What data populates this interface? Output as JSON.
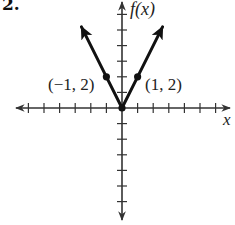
{
  "problem_number": "2.",
  "chart_data": {
    "type": "line",
    "title": "",
    "function": "f(x) = 2|x|",
    "xlabel": "x",
    "ylabel": "f(x)",
    "xlim": [
      -6,
      6
    ],
    "ylim": [
      -6,
      6
    ],
    "tick_interval": 1,
    "grid": false,
    "legend": null,
    "series": [
      {
        "name": "f(x)",
        "x": [
          -2.6,
          -1,
          0,
          1,
          2.6
        ],
        "y": [
          5.2,
          2,
          0,
          2,
          5.2
        ],
        "color": "#111111",
        "arrows_at_ends": true
      }
    ],
    "points": [
      {
        "x": -1,
        "y": 2,
        "label": "(−1, 2)"
      },
      {
        "x": 0,
        "y": 0,
        "label": ""
      },
      {
        "x": 1,
        "y": 2,
        "label": "(1, 2)"
      }
    ]
  },
  "labels": {
    "y_axis": "f(x)",
    "x_axis": "x",
    "point_left": "(−1, 2)",
    "point_right": "(1, 2)"
  },
  "colors": {
    "axis": "#333333",
    "curve": "#111111",
    "background": "#ffffff"
  }
}
